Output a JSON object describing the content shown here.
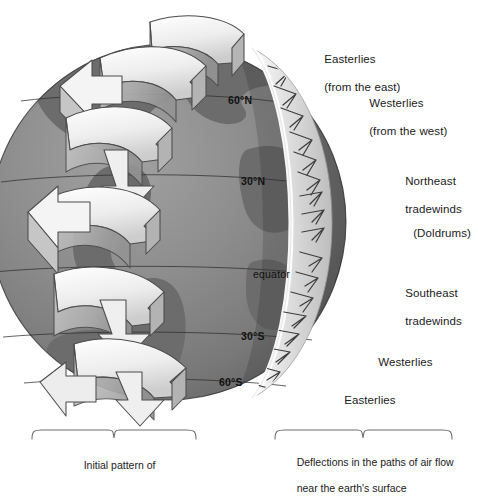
{
  "figure": {
    "background": "#ffffff",
    "globe": {
      "ocean_color": "#8d8d8d",
      "land_color": "#6c6c6c",
      "shadow_color": "#5a5a5a",
      "crescent_color": "#dcdcdc",
      "outline_color": "#2a2a2a"
    },
    "arrow_color": "#f2f2f2",
    "arrow_shade": "#b9b9b9",
    "arrow_outline": "#4a4a4a"
  },
  "latitudes": [
    {
      "id": "lat-60n",
      "label": "60°N",
      "x": 228,
      "y": 101
    },
    {
      "id": "lat-30n",
      "label": "30°N",
      "x": 241,
      "y": 182
    },
    {
      "id": "lat-equator",
      "label": "equator",
      "x": 253,
      "y": 275
    },
    {
      "id": "lat-30s",
      "label": "30°S",
      "x": 241,
      "y": 337
    },
    {
      "id": "lat-60s",
      "label": "60°S",
      "x": 219,
      "y": 383
    }
  ],
  "wind_labels": [
    {
      "id": "easterlies-north",
      "line1": "Easterlies",
      "line2": "(from the east)",
      "x": 311,
      "y": 38
    },
    {
      "id": "westerlies-north",
      "line1": "Westerlies",
      "line2": "(from the west)",
      "x": 356,
      "y": 82
    },
    {
      "id": "northeast-tradewinds",
      "line1": "Northeast",
      "line2": "tradewinds",
      "x": 392,
      "y": 160
    },
    {
      "id": "doldrums",
      "line1": "(Doldrums)",
      "line2": "",
      "x": 400,
      "y": 212
    },
    {
      "id": "southeast-tradewinds",
      "line1": "Southeast",
      "line2": "tradewinds",
      "x": 392,
      "y": 272
    },
    {
      "id": "westerlies-south",
      "line1": "Westerlies",
      "line2": "",
      "x": 365,
      "y": 341
    },
    {
      "id": "easterlies-south",
      "line1": "Easterlies",
      "line2": "",
      "x": 331,
      "y": 379
    }
  ],
  "captions": [
    {
      "id": "caption-left",
      "line1": "Initial pattern of",
      "line2": "",
      "x": 72,
      "y": 451,
      "brace": {
        "x1": 32,
        "x2": 196,
        "y": 432,
        "tip": 114
      }
    },
    {
      "id": "caption-right",
      "line1": "Deflections in the paths of air flow",
      "line2": "near the earth's surface",
      "x": 285,
      "y": 448,
      "brace": {
        "x1": 275,
        "x2": 452,
        "y": 432,
        "tip": 363
      }
    }
  ],
  "cells": [
    {
      "id": "polar-cell-north",
      "name": "polar cell north"
    },
    {
      "id": "ferrel-cell-north",
      "name": "ferrel cell north"
    },
    {
      "id": "hadley-cell-north",
      "name": "hadley cell north"
    },
    {
      "id": "hadley-cell-south",
      "name": "hadley cell south"
    },
    {
      "id": "ferrel-cell-south",
      "name": "ferrel cell south"
    },
    {
      "id": "polar-cell-south",
      "name": "polar cell south"
    }
  ]
}
